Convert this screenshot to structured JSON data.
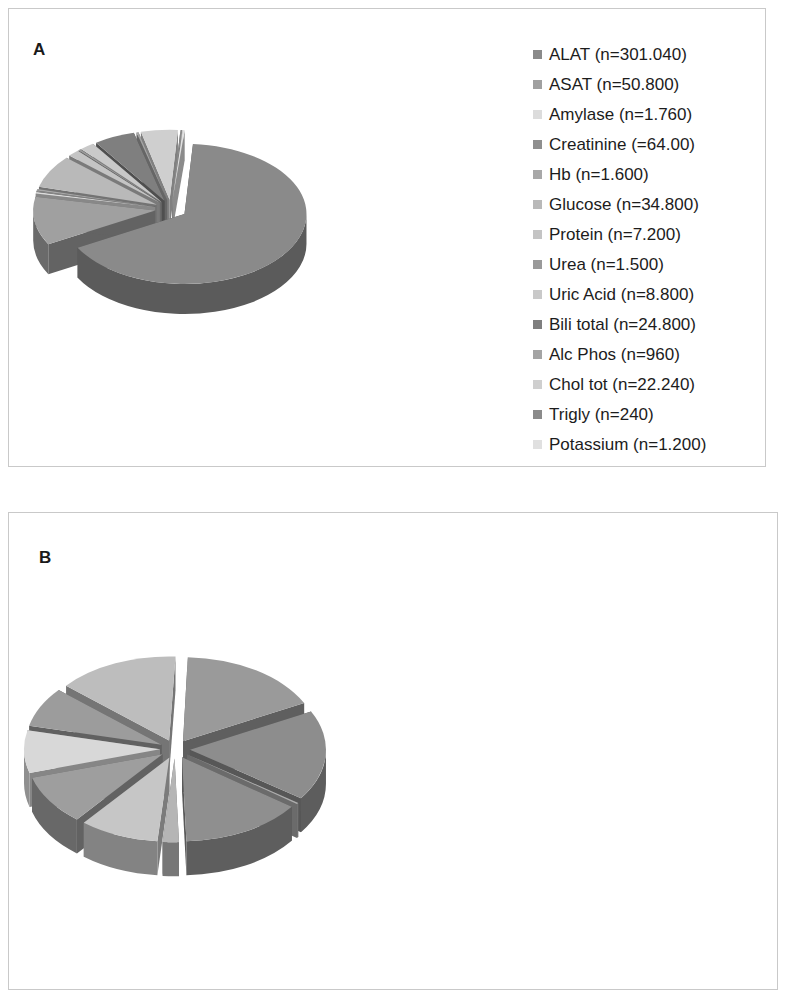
{
  "figure": {
    "panels": [
      {
        "letter": "A",
        "legend": [
          {
            "label": "ALAT (n=301.040)",
            "color": "#8a8a8a"
          },
          {
            "label": "ASAT (n=50.800)",
            "color": "#a0a0a0"
          },
          {
            "label": "Amylase (n=1.760)",
            "color": "#dcdcdc"
          },
          {
            "label": "Creatinine (=64.00)",
            "color": "#8f8f8f"
          },
          {
            "label": "Hb (n=1.600)",
            "color": "#a8a8a8"
          },
          {
            "label": "Glucose (n=34.800)",
            "color": "#b9b9b9"
          },
          {
            "label": "Protein (n=7.200)",
            "color": "#c4c4c4"
          },
          {
            "label": "Urea (n=1.500)",
            "color": "#9a9a9a"
          },
          {
            "label": "Uric Acid (n=8.800)",
            "color": "#c9c9c9"
          },
          {
            "label": "Bili total (n=24.800)",
            "color": "#7f7f7f"
          },
          {
            "label": "Alc Phos (n=960)",
            "color": "#a4a4a4"
          },
          {
            "label": "Chol tot (n=22.240)",
            "color": "#cfcfcf"
          },
          {
            "label": "Trigly (n=240)",
            "color": "#8b8b8b"
          },
          {
            "label": "Potassium (n=1.200)",
            "color": "#e0e0e0"
          }
        ]
      },
      {
        "letter": "B",
        "legend": [
          {
            "label": "ALAT (n=2.640)",
            "color": "#9a9a9a"
          },
          {
            "label": "ASAT (n=2.700)",
            "color": "#8d8d8d"
          },
          {
            "label": "Amylase (n=9)",
            "color": "#adadad"
          },
          {
            "label": "Crea (n=2.250)",
            "color": "#8f8f8f"
          },
          {
            "label": "Hb (n=300)",
            "color": "#b5b5b5"
          },
          {
            "label": "Glucose (n=1.470)",
            "color": "#c6c6c6"
          },
          {
            "label": "Protein (n=0)",
            "color": "#7a7a7a"
          },
          {
            "label": "Urea (n=1.500)",
            "color": "#9e9e9e"
          },
          {
            "label": "Uric Acid (n=1.275)",
            "color": "#d8d8d8"
          },
          {
            "label": "Bili total (n=1.200)",
            "color": "#9c9c9c"
          },
          {
            "label": "Alc Phos (n=0)",
            "color": "#5f5f5f"
          },
          {
            "label": "Chol tot (n=0)",
            "color": "#dedede"
          },
          {
            "label": "Trigly (n=0)",
            "color": "#8a8a8a"
          },
          {
            "label": "Potassium (n=2.250)",
            "color": "#bdbdbd"
          }
        ]
      }
    ]
  },
  "chart_data": [
    {
      "type": "pie",
      "title": "A",
      "exploded": true,
      "three_d": true,
      "legend_position": "right",
      "categories": [
        "ALAT",
        "ASAT",
        "Amylase",
        "Creatinine",
        "Hb",
        "Glucose",
        "Protein",
        "Urea",
        "Uric Acid",
        "Bili total",
        "Alc Phos",
        "Chol tot",
        "Trigly",
        "Potassium"
      ],
      "tick_labels": [
        "ALAT (n=301.040)",
        "ASAT (n=50.800)",
        "Amylase (n=1.760)",
        "Creatinine (=64.00)",
        "Hb (n=1.600)",
        "Glucose (n=34.800)",
        "Protein (n=7.200)",
        "Urea (n=1.500)",
        "Uric Acid (n=8.800)",
        "Bili total (n=24.800)",
        "Alc Phos (n=960)",
        "Chol tot (n=22.240)",
        "Trigly (n=240)",
        "Potassium (n=1.200)"
      ],
      "values": [
        301040,
        50800,
        1760,
        64,
        1600,
        34800,
        7200,
        1500,
        8800,
        24800,
        960,
        22240,
        240,
        1200
      ],
      "colors": [
        "#8a8a8a",
        "#a0a0a0",
        "#dcdcdc",
        "#8f8f8f",
        "#a8a8a8",
        "#b9b9b9",
        "#c4c4c4",
        "#9a9a9a",
        "#c9c9c9",
        "#7f7f7f",
        "#a4a4a4",
        "#cfcfcf",
        "#8b8b8b",
        "#e0e0e0"
      ]
    },
    {
      "type": "pie",
      "title": "B",
      "exploded": true,
      "three_d": true,
      "legend_position": "right",
      "categories": [
        "ALAT",
        "ASAT",
        "Amylase",
        "Crea",
        "Hb",
        "Glucose",
        "Protein",
        "Urea",
        "Uric Acid",
        "Bili total",
        "Alc Phos",
        "Chol tot",
        "Trigly",
        "Potassium"
      ],
      "tick_labels": [
        "ALAT (n=2.640)",
        "ASAT (n=2.700)",
        "Amylase (n=9)",
        "Crea (n=2.250)",
        "Hb (n=300)",
        "Glucose (n=1.470)",
        "Protein (n=0)",
        "Urea (n=1.500)",
        "Uric Acid (n=1.275)",
        "Bili total (n=1.200)",
        "Alc Phos (n=0)",
        "Chol tot (n=0)",
        "Trigly (n=0)",
        "Potassium (n=2.250)"
      ],
      "values": [
        2640,
        2700,
        9,
        2250,
        300,
        1470,
        0,
        1500,
        1275,
        1200,
        0,
        0,
        0,
        2250
      ],
      "colors": [
        "#9a9a9a",
        "#8d8d8d",
        "#adadad",
        "#8f8f8f",
        "#b5b5b5",
        "#c6c6c6",
        "#7a7a7a",
        "#9e9e9e",
        "#d8d8d8",
        "#9c9c9c",
        "#5f5f5f",
        "#dedede",
        "#8a8a8a",
        "#bdbdbd"
      ]
    }
  ]
}
